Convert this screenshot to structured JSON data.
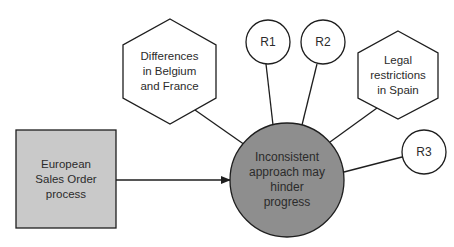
{
  "diagram": {
    "type": "risk-impact diagram",
    "colors": {
      "process_fill": "#c9c9c9",
      "impact_fill": "#8e8e8e",
      "stroke": "#1e1e1e",
      "text": "#2b2b2b",
      "background": "#ffffff"
    },
    "nodes": {
      "process": {
        "label": "European\nSales Order\nprocess",
        "shape": "square"
      },
      "impact": {
        "label": "Inconsistent\napproach may\nhinder\nprogress",
        "shape": "circle"
      },
      "cause_belgium_france": {
        "label": "Differences\nin Belgium\nand France",
        "shape": "hexagon"
      },
      "cause_spain": {
        "label": "Legal\nrestrictions\nin Spain",
        "shape": "hexagon"
      },
      "r1": {
        "label": "R1",
        "shape": "circle"
      },
      "r2": {
        "label": "R2",
        "shape": "circle"
      },
      "r3": {
        "label": "R3",
        "shape": "circle"
      }
    },
    "edges": [
      {
        "from": "process",
        "to": "impact",
        "arrow": true
      },
      {
        "from": "cause_belgium_france",
        "to": "impact",
        "arrow": false
      },
      {
        "from": "r1",
        "to": "impact",
        "arrow": false
      },
      {
        "from": "r2",
        "to": "impact",
        "arrow": false
      },
      {
        "from": "cause_spain",
        "to": "impact",
        "arrow": false
      },
      {
        "from": "r3",
        "to": "impact",
        "arrow": false
      }
    ]
  }
}
